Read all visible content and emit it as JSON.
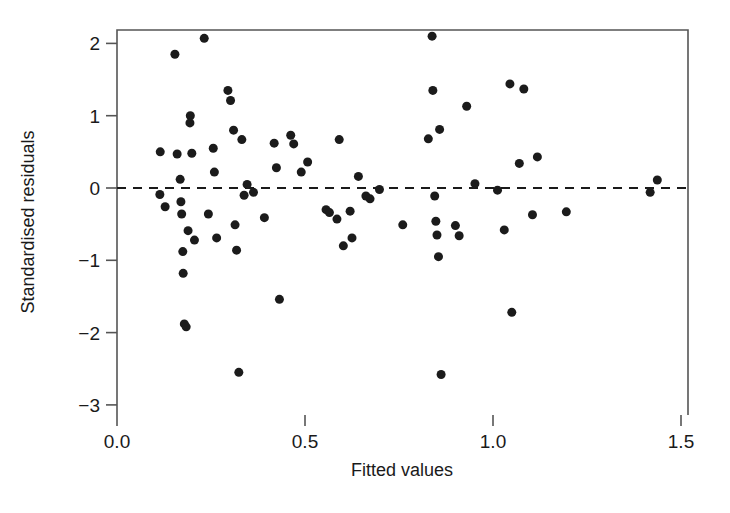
{
  "chart_data": {
    "type": "scatter",
    "title": "",
    "xlabel": "Fitted values",
    "ylabel": "Standardised residuals",
    "xlim": [
      0.0,
      1.5
    ],
    "ylim": [
      -3,
      2.2
    ],
    "xticks": [
      "0.0",
      "0.5",
      "1.0",
      "1.5"
    ],
    "xtick_values": [
      0.0,
      0.5,
      1.0,
      1.5
    ],
    "yticks": [
      "2",
      "1",
      "0",
      "-1",
      "-2",
      "-3"
    ],
    "ytick_values": [
      2,
      1,
      0,
      -1,
      -2,
      -3
    ],
    "grid": false,
    "legend": null,
    "reference_line": {
      "type": "horizontal",
      "y": 0,
      "style": "dashed"
    },
    "marker": {
      "shape": "circle",
      "color": "#1b1b1b",
      "size": 9
    },
    "points": [
      {
        "x": 0.115,
        "y": 0.5
      },
      {
        "x": 0.114,
        "y": -0.09
      },
      {
        "x": 0.128,
        "y": -0.26
      },
      {
        "x": 0.154,
        "y": 1.85
      },
      {
        "x": 0.16,
        "y": 0.47
      },
      {
        "x": 0.168,
        "y": 0.12
      },
      {
        "x": 0.17,
        "y": -0.19
      },
      {
        "x": 0.172,
        "y": -0.36
      },
      {
        "x": 0.175,
        "y": -0.88
      },
      {
        "x": 0.176,
        "y": -1.18
      },
      {
        "x": 0.179,
        "y": -1.88
      },
      {
        "x": 0.184,
        "y": -1.92
      },
      {
        "x": 0.189,
        "y": -0.59
      },
      {
        "x": 0.194,
        "y": 0.9
      },
      {
        "x": 0.195,
        "y": 1.0
      },
      {
        "x": 0.199,
        "y": 0.48
      },
      {
        "x": 0.206,
        "y": -0.72
      },
      {
        "x": 0.232,
        "y": 2.07
      },
      {
        "x": 0.243,
        "y": -0.36
      },
      {
        "x": 0.256,
        "y": 0.55
      },
      {
        "x": 0.259,
        "y": 0.22
      },
      {
        "x": 0.265,
        "y": -0.69
      },
      {
        "x": 0.295,
        "y": 1.35
      },
      {
        "x": 0.302,
        "y": 1.21
      },
      {
        "x": 0.31,
        "y": 0.8
      },
      {
        "x": 0.314,
        "y": -0.51
      },
      {
        "x": 0.318,
        "y": -0.86
      },
      {
        "x": 0.324,
        "y": -2.55
      },
      {
        "x": 0.332,
        "y": 0.67
      },
      {
        "x": 0.338,
        "y": -0.1
      },
      {
        "x": 0.346,
        "y": 0.05
      },
      {
        "x": 0.363,
        "y": -0.06
      },
      {
        "x": 0.392,
        "y": -0.41
      },
      {
        "x": 0.418,
        "y": 0.62
      },
      {
        "x": 0.424,
        "y": 0.28
      },
      {
        "x": 0.432,
        "y": -1.54
      },
      {
        "x": 0.462,
        "y": 0.73
      },
      {
        "x": 0.47,
        "y": 0.61
      },
      {
        "x": 0.49,
        "y": 0.22
      },
      {
        "x": 0.507,
        "y": 0.36
      },
      {
        "x": 0.556,
        "y": -0.3
      },
      {
        "x": 0.565,
        "y": -0.34
      },
      {
        "x": 0.585,
        "y": -0.43
      },
      {
        "x": 0.591,
        "y": 0.67
      },
      {
        "x": 0.602,
        "y": -0.8
      },
      {
        "x": 0.62,
        "y": -0.32
      },
      {
        "x": 0.625,
        "y": -0.69
      },
      {
        "x": 0.642,
        "y": 0.16
      },
      {
        "x": 0.662,
        "y": -0.11
      },
      {
        "x": 0.673,
        "y": -0.15
      },
      {
        "x": 0.698,
        "y": -0.02
      },
      {
        "x": 0.76,
        "y": -0.51
      },
      {
        "x": 0.828,
        "y": 0.68
      },
      {
        "x": 0.838,
        "y": 2.1
      },
      {
        "x": 0.84,
        "y": 1.35
      },
      {
        "x": 0.845,
        "y": -0.11
      },
      {
        "x": 0.848,
        "y": -0.46
      },
      {
        "x": 0.851,
        "y": -0.65
      },
      {
        "x": 0.855,
        "y": -0.95
      },
      {
        "x": 0.858,
        "y": 0.81
      },
      {
        "x": 0.862,
        "y": -2.58
      },
      {
        "x": 0.9,
        "y": -0.52
      },
      {
        "x": 0.91,
        "y": -0.66
      },
      {
        "x": 0.93,
        "y": 1.13
      },
      {
        "x": 0.952,
        "y": 0.06
      },
      {
        "x": 1.012,
        "y": -0.03
      },
      {
        "x": 1.03,
        "y": -0.58
      },
      {
        "x": 1.045,
        "y": 1.44
      },
      {
        "x": 1.05,
        "y": -1.72
      },
      {
        "x": 1.07,
        "y": 0.34
      },
      {
        "x": 1.082,
        "y": 1.37
      },
      {
        "x": 1.105,
        "y": -0.37
      },
      {
        "x": 1.118,
        "y": 0.43
      },
      {
        "x": 1.195,
        "y": -0.33
      },
      {
        "x": 1.418,
        "y": -0.06
      },
      {
        "x": 1.437,
        "y": 0.11
      }
    ]
  },
  "layout": {
    "plot_left": 117,
    "plot_right": 688,
    "plot_top": 30,
    "plot_bottom": 415,
    "x0_px": 117,
    "x_per_unit": 376,
    "y0_px": 188,
    "y_per_unit": 72.3
  }
}
